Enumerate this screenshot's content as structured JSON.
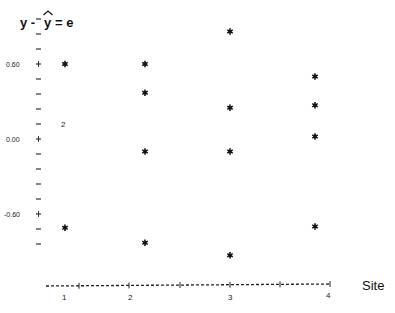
{
  "chart_data": {
    "type": "scatter",
    "xlabel": "Site",
    "ylabel": "y - ŷ = e",
    "x_ticks": [
      "1",
      "2",
      "3",
      "4"
    ],
    "y_ticks": [
      {
        "value": 0.6,
        "label": "0.60"
      },
      {
        "value": 0.0,
        "label": "0.00"
      },
      {
        "value": -0.6,
        "label": "-0.60"
      }
    ],
    "y_minor_step": 0.12,
    "ylim": [
      -1.1,
      0.85
    ],
    "xlim": [
      0.5,
      4.5
    ],
    "grid": false,
    "legend": null,
    "marker": "*",
    "series": [
      {
        "name": "Site 1",
        "x": 1,
        "values": [
          0.6,
          0.13,
          -0.71
        ]
      },
      {
        "name": "Site 2",
        "x": 2,
        "values": [
          0.6,
          0.37,
          -0.1,
          -0.83
        ]
      },
      {
        "name": "Site 3",
        "x": 3,
        "values": [
          0.86,
          0.25,
          -0.1,
          -0.93
        ]
      },
      {
        "name": "Site 4",
        "x": 4,
        "values": [
          0.5,
          0.27,
          0.02,
          -0.7
        ]
      }
    ],
    "annotations": [
      {
        "text": "2",
        "x": 1,
        "y": 0.13,
        "note": "two coincident observations"
      }
    ]
  },
  "labels": {
    "title_left": "y - ",
    "title_hat": "y",
    "title_right": "= e",
    "y_tick_060": "0.60",
    "y_tick_000": "0.00",
    "y_tick_neg060": "-0.60",
    "x_tick_1": "1",
    "x_tick_2": "2",
    "x_tick_3": "3",
    "x_tick_4": "4",
    "xlabel": "Site",
    "annot_2": "2"
  }
}
